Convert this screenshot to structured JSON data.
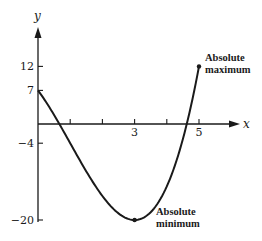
{
  "chart_data": {
    "type": "line",
    "title": "",
    "xlabel": "x",
    "ylabel": "y",
    "function": "y = x^3 - 3x^2 - 9x + 7",
    "domain": [
      0,
      5
    ],
    "xlim": [
      0,
      5.9
    ],
    "ylim": [
      -21,
      20
    ],
    "grid": false,
    "x_ticks": [
      1,
      2,
      3,
      4,
      5
    ],
    "x_tick_labels": [
      {
        "value": 3,
        "label": "3"
      },
      {
        "value": 5,
        "label": "5"
      }
    ],
    "y_ticks": [
      12,
      7,
      -4,
      -20
    ],
    "y_tick_labels": [
      {
        "value": 12,
        "label": "12"
      },
      {
        "value": 7,
        "label": "7"
      },
      {
        "value": -4,
        "label": "−4"
      },
      {
        "value": -20,
        "label": "−20"
      }
    ],
    "series": [
      {
        "name": "f(x)",
        "x": [
          0,
          0.5,
          1,
          1.5,
          2,
          2.5,
          3,
          3.5,
          4,
          4.5,
          5
        ],
        "y": [
          7,
          1.875,
          -4,
          -9.125,
          -15,
          -18.125,
          -20,
          -18.125,
          -13,
          -4.125,
          12
        ]
      }
    ],
    "points": [
      {
        "x": 5,
        "y": 12,
        "label": "Absolute maximum"
      },
      {
        "x": 3,
        "y": -20,
        "label": "Absolute minimum"
      }
    ],
    "annotations": [
      {
        "line1": "Absolute",
        "line2": "maximum",
        "at": [
          5,
          12
        ]
      },
      {
        "line1": "Absolute",
        "line2": "minimum",
        "at": [
          3,
          -20
        ]
      }
    ]
  },
  "labels": {
    "x_axis": "x",
    "y_axis": "y",
    "max_line1": "Absolute",
    "max_line2": "maximum",
    "min_line1": "Absolute",
    "min_line2": "minimum"
  },
  "colors": {
    "ink": "#1a1a1a",
    "background": "#ffffff"
  }
}
